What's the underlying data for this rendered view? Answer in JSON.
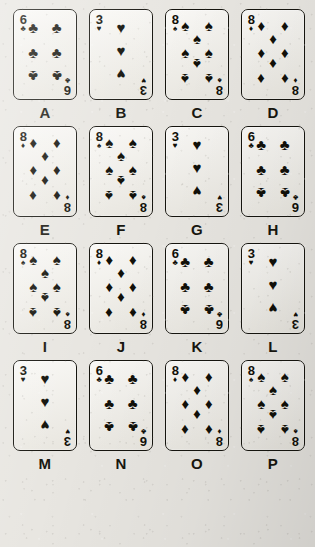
{
  "page": {
    "kind": "playing-card-grid-puzzle",
    "background_color": "#e8e6e1",
    "ink_color": "#111009",
    "rows": 4,
    "columns": 4,
    "card_count": 16
  },
  "suit_glyphs": {
    "spades": "♠",
    "hearts": "♥",
    "diamonds": "♦",
    "clubs": "♣"
  },
  "cards": [
    {
      "label": "A",
      "rank": "6",
      "suit": "clubs",
      "suit_glyph": "♣",
      "pip_count": 6
    },
    {
      "label": "B",
      "rank": "3",
      "suit": "hearts",
      "suit_glyph": "♥",
      "pip_count": 3
    },
    {
      "label": "C",
      "rank": "8",
      "suit": "spades",
      "suit_glyph": "♠",
      "pip_count": 8
    },
    {
      "label": "D",
      "rank": "8",
      "suit": "diamonds",
      "suit_glyph": "♦",
      "pip_count": 8
    },
    {
      "label": "E",
      "rank": "8",
      "suit": "diamonds",
      "suit_glyph": "♦",
      "pip_count": 8
    },
    {
      "label": "F",
      "rank": "8",
      "suit": "spades",
      "suit_glyph": "♠",
      "pip_count": 8
    },
    {
      "label": "G",
      "rank": "3",
      "suit": "hearts",
      "suit_glyph": "♥",
      "pip_count": 3
    },
    {
      "label": "H",
      "rank": "6",
      "suit": "clubs",
      "suit_glyph": "♣",
      "pip_count": 6
    },
    {
      "label": "I",
      "rank": "8",
      "suit": "spades",
      "suit_glyph": "♠",
      "pip_count": 8
    },
    {
      "label": "J",
      "rank": "8",
      "suit": "diamonds",
      "suit_glyph": "♦",
      "pip_count": 8
    },
    {
      "label": "K",
      "rank": "6",
      "suit": "clubs",
      "suit_glyph": "♣",
      "pip_count": 6
    },
    {
      "label": "L",
      "rank": "3",
      "suit": "hearts",
      "suit_glyph": "♥",
      "pip_count": 3
    },
    {
      "label": "M",
      "rank": "3",
      "suit": "hearts",
      "suit_glyph": "♥",
      "pip_count": 3
    },
    {
      "label": "N",
      "rank": "6",
      "suit": "clubs",
      "suit_glyph": "♣",
      "pip_count": 6
    },
    {
      "label": "O",
      "rank": "8",
      "suit": "diamonds",
      "suit_glyph": "♦",
      "pip_count": 8
    },
    {
      "label": "P",
      "rank": "8",
      "suit": "spades",
      "suit_glyph": "♠",
      "pip_count": 8
    }
  ],
  "pip_layouts": {
    "3": [
      {
        "x": 50,
        "y": 11,
        "flip": false
      },
      {
        "x": 50,
        "y": 44,
        "flip": false
      },
      {
        "x": 50,
        "y": 78,
        "flip": true
      }
    ],
    "6": [
      {
        "x": 19,
        "y": 11,
        "flip": false
      },
      {
        "x": 81,
        "y": 11,
        "flip": false
      },
      {
        "x": 19,
        "y": 46,
        "flip": false
      },
      {
        "x": 81,
        "y": 46,
        "flip": false
      },
      {
        "x": 19,
        "y": 80,
        "flip": true
      },
      {
        "x": 81,
        "y": 80,
        "flip": true
      }
    ],
    "8": [
      {
        "x": 19,
        "y": 8,
        "flip": false
      },
      {
        "x": 81,
        "y": 8,
        "flip": false
      },
      {
        "x": 50,
        "y": 27,
        "flip": false
      },
      {
        "x": 19,
        "y": 46,
        "flip": false
      },
      {
        "x": 81,
        "y": 46,
        "flip": false
      },
      {
        "x": 50,
        "y": 64,
        "flip": true
      },
      {
        "x": 19,
        "y": 84,
        "flip": true
      },
      {
        "x": 81,
        "y": 84,
        "flip": true
      }
    ]
  }
}
